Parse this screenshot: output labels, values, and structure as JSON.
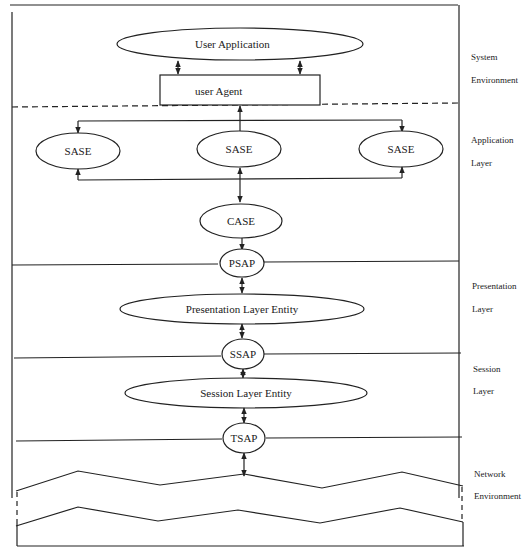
{
  "diagram": {
    "nodes": {
      "user_application": "User Application",
      "user_agent": "user Agent",
      "sase_left": "SASE",
      "sase_center": "SASE",
      "sase_right": "SASE",
      "case": "CASE",
      "psap": "PSAP",
      "presentation_entity": "Presentation Layer Entity",
      "ssap": "SSAP",
      "session_entity": "Session Layer Entity",
      "tsap": "TSAP"
    },
    "layers": [
      {
        "line1": "System",
        "line2": "Environment"
      },
      {
        "line1": "Application",
        "line2": "Layer"
      },
      {
        "line1": "Presentation",
        "line2": "Layer"
      },
      {
        "line1": "Session",
        "line2": "Layer"
      },
      {
        "line1": "Network",
        "line2": "Environment"
      }
    ]
  }
}
